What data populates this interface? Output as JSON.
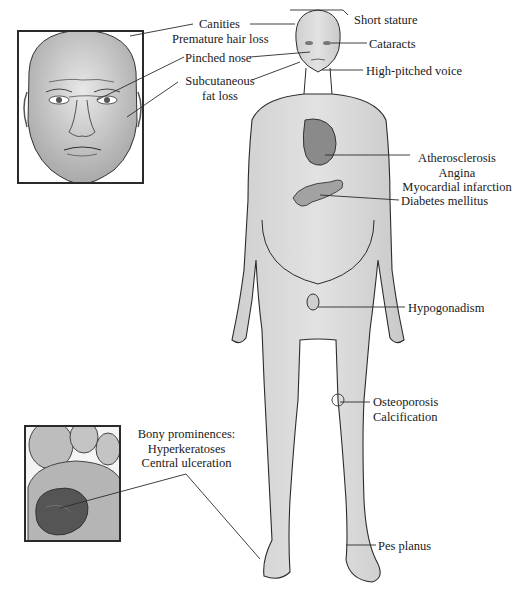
{
  "figure": {
    "face_inset": {
      "labels": [
        {
          "id": "canities",
          "lines": [
            "Canities",
            "Premature hair loss"
          ]
        },
        {
          "id": "pinched-nose",
          "lines": [
            "Pinched nose"
          ]
        },
        {
          "id": "subcutaneous-fat-loss",
          "lines": [
            "Subcutaneous",
            "fat loss"
          ]
        }
      ]
    },
    "body_labels": {
      "short_stature": "Short stature",
      "cataracts": "Cataracts",
      "high_pitched_voice": "High-pitched voice",
      "heart": [
        "Atherosclerosis",
        "Angina",
        "Myocardial infarction"
      ],
      "pancreas": "Diabetes mellitus",
      "gonads": "Hypogonadism",
      "knee": [
        "Osteoporosis",
        "Calcification"
      ],
      "foot_right": "Pes planus"
    },
    "foot_inset": {
      "label": [
        "Bony prominences:",
        "Hyperkeratoses",
        "Central ulceration"
      ]
    },
    "colors": {
      "skin": "#d9d9d9",
      "outline": "#2b2b2b",
      "organ": "#8a8a8a",
      "ulcer": "#5a5a5a"
    }
  }
}
